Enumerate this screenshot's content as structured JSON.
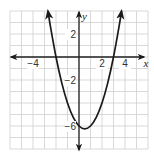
{
  "chart_data": {
    "type": "line",
    "title": "",
    "xlabel": "x",
    "ylabel": "y",
    "xlim": [
      -6,
      6
    ],
    "ylim": [
      -8,
      4
    ],
    "grid": true,
    "grid_step": 1,
    "legend": null,
    "x_tick_labels": [
      {
        "value": -4,
        "label": "−4"
      },
      {
        "value": 2,
        "label": "2"
      },
      {
        "value": 4,
        "label": "4"
      }
    ],
    "y_tick_labels": [
      {
        "value": 2,
        "label": "2"
      },
      {
        "value": -2,
        "label": "−2"
      },
      {
        "value": -6,
        "label": "−6"
      }
    ],
    "series": [
      {
        "name": "parabola",
        "equation": "y = x^2 - x - 6",
        "x_intercepts": [
          -2,
          3
        ],
        "y_intercept": -6,
        "vertex": [
          0.5,
          -6.25
        ],
        "x": [
          -2.7,
          -2.5,
          -2,
          -1.5,
          -1,
          -0.5,
          0,
          0.5,
          1,
          1.5,
          2,
          2.5,
          3,
          3.5,
          3.7
        ],
        "values": [
          4.0,
          2.75,
          0,
          -2.25,
          -4,
          -5.25,
          -6,
          -6.25,
          -6,
          -5.25,
          -4,
          -2.25,
          0,
          2.75,
          4.0
        ],
        "arrows_at_ends": true
      }
    ]
  },
  "colors": {
    "grid": "#cfcfcf",
    "axis": "#222222",
    "curve": "#1a1a1a",
    "background": "#ffffff"
  }
}
